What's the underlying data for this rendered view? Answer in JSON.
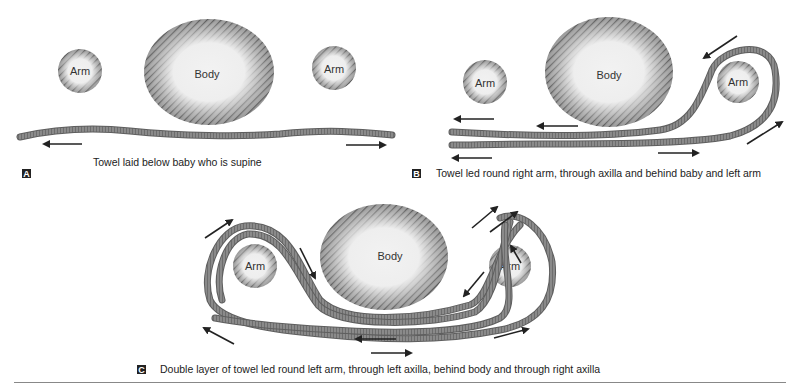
{
  "panels": [
    {
      "letter": "A",
      "caption": "Towel laid below baby who is supine",
      "labels": {
        "left_arm": "Arm",
        "body": "Body",
        "right_arm": "Arm"
      }
    },
    {
      "letter": "B",
      "caption": "Towel led round right arm, through axilla and behind baby and left arm",
      "labels": {
        "left_arm": "Arm",
        "body": "Body",
        "right_arm": "Arm"
      }
    },
    {
      "letter": "C",
      "caption": "Double layer of towel led round left arm, through left axilla, behind body and through right axilla",
      "labels": {
        "left_arm": "Arm",
        "body": "Body",
        "right_arm": "Arm"
      }
    }
  ],
  "colors": {
    "hatch": "#6b6b6b",
    "fill_center": "#efefef",
    "towel": "#7a7a7a",
    "arrow": "#222222"
  }
}
